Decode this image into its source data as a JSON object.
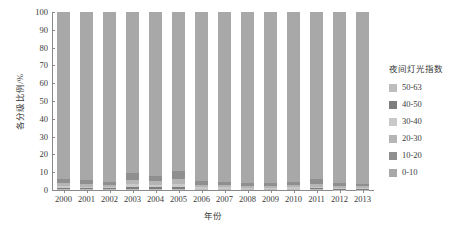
{
  "chart_data": {
    "type": "bar",
    "stacked": true,
    "title": "",
    "xlabel": "年份",
    "ylabel": "各分级比例/%",
    "ylim": [
      0,
      100
    ],
    "yticks": [
      0,
      10,
      20,
      30,
      40,
      50,
      60,
      70,
      80,
      90,
      100
    ],
    "grid": false,
    "legend_position": "right",
    "legend_title": "夜间灯光指数",
    "categories": [
      "2000",
      "2001",
      "2002",
      "2003",
      "2004",
      "2005",
      "2006",
      "2007",
      "2008",
      "2009",
      "2010",
      "2011",
      "2012",
      "2013"
    ],
    "series": [
      {
        "name": "0-10",
        "color": "#a8a8a8",
        "values": [
          93.6,
          94.5,
          95.2,
          90.2,
          92.0,
          89.4,
          94.8,
          95.4,
          96.3,
          95.8,
          95.3,
          94.0,
          96.0,
          96.4
        ]
      },
      {
        "name": "10-20",
        "color": "#8f8f8f",
        "values": [
          2.6,
          2.3,
          1.9,
          4.0,
          3.2,
          4.6,
          2.2,
          1.9,
          1.5,
          1.8,
          2.0,
          2.6,
          1.7,
          1.5
        ]
      },
      {
        "name": "20-30",
        "color": "#b5b5b5",
        "values": [
          1.5,
          1.3,
          1.2,
          2.3,
          1.9,
          2.6,
          1.3,
          1.1,
          0.9,
          1.0,
          1.1,
          1.5,
          1.0,
          0.9
        ]
      },
      {
        "name": "30-40",
        "color": "#c9c9c9",
        "values": [
          1.0,
          0.9,
          0.8,
          1.6,
          1.3,
          1.8,
          0.9,
          0.8,
          0.6,
          0.7,
          0.8,
          1.0,
          0.7,
          0.6
        ]
      },
      {
        "name": "40-50",
        "color": "#7d7d7d",
        "values": [
          0.8,
          0.6,
          0.5,
          1.1,
          0.9,
          1.1,
          0.5,
          0.5,
          0.4,
          0.4,
          0.5,
          0.6,
          0.4,
          0.4
        ]
      },
      {
        "name": "50-63",
        "color": "#bdbdbd",
        "values": [
          0.5,
          0.4,
          0.4,
          0.8,
          0.7,
          0.5,
          0.3,
          0.3,
          0.3,
          0.3,
          0.3,
          0.3,
          0.2,
          0.2
        ]
      }
    ],
    "legend_entries": [
      {
        "label": "50-63",
        "color": "#bdbdbd"
      },
      {
        "label": "40-50",
        "color": "#7d7d7d"
      },
      {
        "label": "30-40",
        "color": "#c9c9c9"
      },
      {
        "label": "20-30",
        "color": "#b5b5b5"
      },
      {
        "label": "10-20",
        "color": "#8f8f8f"
      },
      {
        "label": "0-10",
        "color": "#a8a8a8"
      }
    ]
  }
}
